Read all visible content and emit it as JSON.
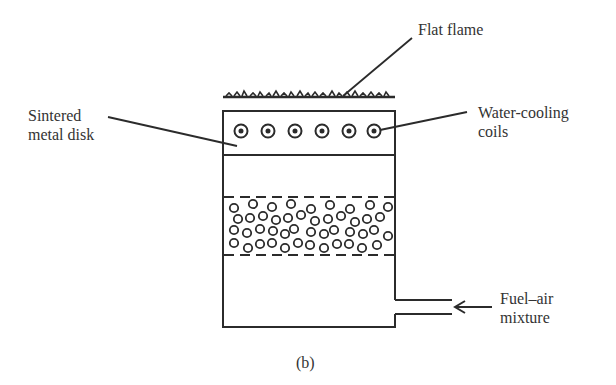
{
  "diagram": {
    "type": "flat-flame burner schematic",
    "caption": "(b)",
    "labels": {
      "flat_flame": "Flat flame",
      "sintered_disk_line1": "Sintered",
      "sintered_disk_line2": "metal disk",
      "water_cooling_line1": "Water-cooling",
      "water_cooling_line2": "coils",
      "fuel_air_line1": "Fuel–air",
      "fuel_air_line2": "mixture"
    },
    "components": [
      {
        "name": "flat-flame",
        "description": "rough flame layer on top of burner"
      },
      {
        "name": "sintered-metal-disk",
        "description": "top section of burner with 6 water-cooling coils"
      },
      {
        "name": "water-cooling-coils",
        "count": 6
      },
      {
        "name": "packed-bead-bed",
        "description": "bed of beads between two dashed screens"
      },
      {
        "name": "fuel-air-inlet",
        "description": "side pipe at lower right with inflow arrow"
      }
    ],
    "colors": {
      "stroke": "#2b2b2b",
      "background": "#ffffff"
    }
  }
}
